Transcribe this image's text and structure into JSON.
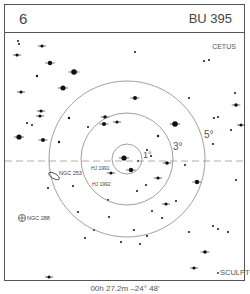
{
  "header": {
    "chart_number": "6",
    "chart_target": "BU 395"
  },
  "footer": {
    "coordinates": "00h 27.2m  –24° 48'"
  },
  "labels": {
    "constellation_top": "CETUS",
    "constellation_bottom": "SCULPTOR",
    "ring_1": "1°",
    "ring_3": "3°",
    "ring_5": "5°",
    "obj_ngc253": "NGC 253",
    "obj_ngc288": "NGC 288",
    "obj_hj1991": "HJ 1991",
    "obj_hj1992": "HJ 1992"
  },
  "colors": {
    "frame": "#555555",
    "ring": "#888888",
    "star": "#111111",
    "dash": "#999999"
  },
  "chart_data": {
    "type": "scatter",
    "center": [
      127,
      159
    ],
    "rings_deg": [
      1,
      3,
      5
    ],
    "ring_radii_px": [
      15,
      46,
      78
    ],
    "dashed_line_y": 161,
    "stars": [
      [
        18,
        41,
        1
      ],
      [
        19,
        44,
        1
      ],
      [
        42,
        46,
        1.6
      ],
      [
        17,
        55,
        1.6
      ],
      [
        50,
        63,
        2.2
      ],
      [
        74,
        72,
        2.8
      ],
      [
        37,
        76,
        1.2
      ],
      [
        63,
        88,
        2.5
      ],
      [
        21,
        92,
        1.6
      ],
      [
        41,
        111,
        1.6
      ],
      [
        40,
        116,
        1.6
      ],
      [
        69,
        118,
        1.2
      ],
      [
        27,
        123,
        1
      ],
      [
        32,
        125,
        1
      ],
      [
        19,
        137,
        2.6
      ],
      [
        43,
        140,
        2
      ],
      [
        59,
        142,
        1.2
      ],
      [
        104,
        124,
        2
      ],
      [
        117,
        122,
        1.6
      ],
      [
        135,
        52,
        1
      ],
      [
        204,
        61,
        1
      ],
      [
        209,
        60,
        1
      ],
      [
        135,
        98,
        2
      ],
      [
        189,
        98,
        1
      ],
      [
        235,
        93,
        1
      ],
      [
        236,
        105,
        1.8
      ],
      [
        214,
        118,
        1
      ],
      [
        218,
        117,
        1
      ],
      [
        241,
        125,
        1.6
      ],
      [
        231,
        130,
        1
      ],
      [
        213,
        144,
        1
      ],
      [
        175,
        124,
        2.8
      ],
      [
        158,
        136,
        1.2
      ],
      [
        105,
        117,
        1.8
      ],
      [
        88,
        127,
        1
      ],
      [
        147,
        150,
        1
      ],
      [
        167,
        163,
        1.8
      ],
      [
        124,
        158,
        2.6
      ],
      [
        138,
        161,
        1
      ],
      [
        131,
        170,
        2.2
      ],
      [
        111,
        173,
        1.6
      ],
      [
        151,
        156,
        1
      ],
      [
        185,
        165,
        1
      ],
      [
        197,
        182,
        2.2
      ],
      [
        146,
        185,
        1
      ],
      [
        158,
        178,
        1.6
      ],
      [
        137,
        191,
        1
      ],
      [
        108,
        200,
        1
      ],
      [
        152,
        211,
        1
      ],
      [
        166,
        204,
        1.6
      ],
      [
        176,
        201,
        1
      ],
      [
        109,
        217,
        1
      ],
      [
        94,
        230,
        1
      ],
      [
        85,
        238,
        1
      ],
      [
        134,
        230,
        1
      ],
      [
        140,
        244,
        1
      ],
      [
        189,
        232,
        1
      ],
      [
        213,
        226,
        1
      ],
      [
        218,
        229,
        1
      ],
      [
        228,
        232,
        1
      ],
      [
        48,
        188,
        1
      ],
      [
        73,
        186,
        1
      ],
      [
        78,
        212,
        1
      ],
      [
        162,
        218,
        1
      ],
      [
        147,
        236,
        1
      ],
      [
        205,
        252,
        1.8
      ],
      [
        194,
        268,
        1.6
      ],
      [
        49,
        277,
        1.6
      ],
      [
        121,
        242,
        1
      ],
      [
        236,
        180,
        1
      ]
    ]
  }
}
